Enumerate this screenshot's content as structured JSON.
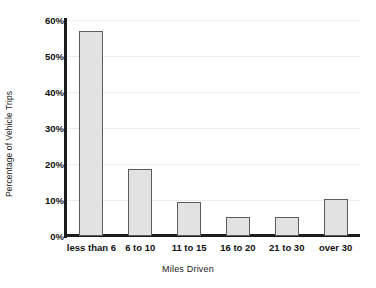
{
  "chart_data": {
    "type": "bar",
    "title": "",
    "xlabel": "Miles Driven",
    "ylabel": "Percentage of Vehicle Trips",
    "categories": [
      "less than 6",
      "6 to 10",
      "11 to 15",
      "16 to 20",
      "21 to 30",
      "over 30"
    ],
    "values": [
      57,
      18.6,
      9.4,
      5.2,
      5.2,
      10.2
    ],
    "value_labels": [
      "57%",
      "18.6%",
      "9.4%",
      "5.2%",
      "5.2%",
      "10.2%"
    ],
    "ylim": [
      0,
      60
    ],
    "ytick_values": [
      0,
      10,
      20,
      30,
      40,
      50,
      60
    ],
    "ytick_labels": [
      "0%",
      "10%",
      "20%",
      "30%",
      "40%",
      "50%",
      "60%"
    ],
    "grid": "horizontal",
    "legend": "none",
    "colors": {
      "bar_fill": "#e2e2e2",
      "bar_edge": "#5c5c5c",
      "axis": "#1c1c1c",
      "gridline": "#ececec",
      "background": "#ffffff",
      "text": "#111111"
    }
  }
}
